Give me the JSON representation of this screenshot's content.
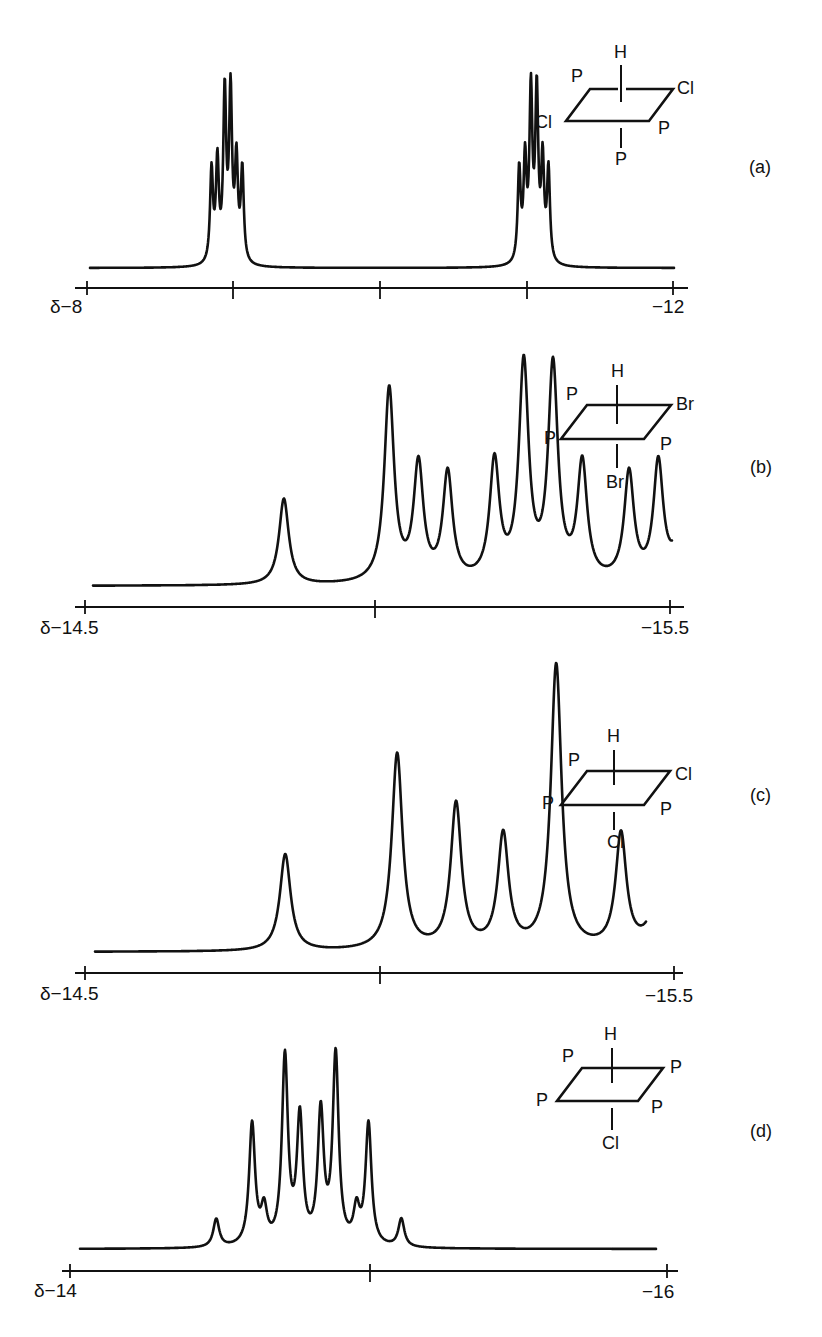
{
  "chart_data": [
    {
      "panel": "(a)",
      "type": "line",
      "title": "",
      "xlabel": "δ (ppm)",
      "ylabel": "",
      "xlim": [
        -8,
        -12
      ],
      "x_ticks": [
        -8,
        -9,
        -10,
        -11,
        -12
      ],
      "x_tick_labels": [
        "δ−8",
        "",
        "",
        "",
        "−12"
      ],
      "grid": false,
      "molecule": {
        "axial_top": "H",
        "axial_bottom": "P",
        "eq_back_left": "P",
        "eq_back_right": "Cl",
        "eq_front_left": "Cl",
        "eq_front_right": "P"
      },
      "multiplets": [
        {
          "center_ppm": -9.0,
          "peaks_ppm": [
            -8.85,
            -8.89,
            -8.94,
            -8.98,
            -9.02,
            -9.06,
            -9.11
          ],
          "rel_heights": [
            0.55,
            0.59,
            1.0,
            1.0,
            0.59,
            0.55,
            0.0
          ]
        },
        {
          "center_ppm": -11.1,
          "peaks_ppm": [
            -10.95,
            -10.99,
            -11.03,
            -11.07,
            -11.11,
            -11.15,
            -11.19
          ],
          "rel_heights": [
            0.55,
            0.59,
            1.0,
            1.0,
            0.59,
            0.55,
            0.0
          ]
        }
      ]
    },
    {
      "panel": "(b)",
      "type": "line",
      "xlabel": "δ (ppm)",
      "xlim": [
        -14.5,
        -15.5
      ],
      "x_ticks": [
        -14.5,
        -15.0,
        -15.5
      ],
      "x_tick_labels": [
        "δ−14.5",
        "",
        "−15.5"
      ],
      "grid": false,
      "molecule": {
        "axial_top": "H",
        "axial_bottom": "Br",
        "eq_back_left": "P",
        "eq_back_right": "Br",
        "eq_front_left": "P",
        "eq_front_right": "P"
      },
      "peaks_ppm": [
        -14.84,
        -15.02,
        -15.07,
        -15.12,
        -15.2,
        -15.25,
        -15.3,
        -15.35,
        -15.43,
        -15.48,
        -15.53,
        -15.71
      ],
      "rel_heights": [
        0.4,
        0.9,
        0.54,
        0.5,
        0.55,
        1.0,
        0.99,
        0.54,
        0.5,
        0.54,
        0.89,
        0.4
      ]
    },
    {
      "panel": "(c)",
      "type": "line",
      "xlabel": "δ (ppm)",
      "xlim": [
        -14.5,
        -15.5
      ],
      "x_ticks": [
        -14.5,
        -15.0,
        -15.5
      ],
      "x_tick_labels": [
        "δ−14.5",
        "",
        "−15.5"
      ],
      "grid": false,
      "molecule": {
        "axial_top": "H",
        "axial_bottom": "Cl",
        "eq_back_left": "P",
        "eq_back_right": "Cl",
        "eq_front_left": "P",
        "eq_front_right": "P"
      },
      "peaks_ppm": [
        -14.84,
        -15.03,
        -15.13,
        -15.21,
        -15.3,
        -15.41,
        -15.48,
        -15.59,
        -15.77
      ],
      "rel_heights": [
        0.34,
        0.69,
        0.51,
        0.4,
        1.0,
        0.4,
        0.51,
        0.69,
        0.34
      ]
    },
    {
      "panel": "(d)",
      "type": "line",
      "xlabel": "δ (ppm)",
      "xlim": [
        -14,
        -16
      ],
      "x_ticks": [
        -14,
        -15,
        -16
      ],
      "x_tick_labels": [
        "δ−14",
        "",
        "−16"
      ],
      "grid": false,
      "molecule": {
        "axial_top": "H",
        "axial_bottom": "Cl",
        "eq_back_left": "P",
        "eq_back_right": "P",
        "eq_front_left": "P",
        "eq_front_right": "P"
      },
      "peaks_ppm": [
        -14.49,
        -14.61,
        -14.65,
        -14.72,
        -14.77,
        -14.84,
        -14.89,
        -14.96,
        -15.0,
        -15.11
      ],
      "rel_heights": [
        0.15,
        0.65,
        0.18,
        1.0,
        0.67,
        0.7,
        1.01,
        0.18,
        0.65,
        0.15
      ]
    }
  ],
  "panels": [
    {
      "label": "(a)",
      "axis_left": "δ−8",
      "axis_right": "−12",
      "mol": {
        "top": "H",
        "bottom": "P",
        "back_left": "P",
        "back_right": "Cl",
        "front_left": "Cl",
        "front_right": "P"
      }
    },
    {
      "label": "(b)",
      "axis_left": "δ−14.5",
      "axis_right": "−15.5",
      "mol": {
        "top": "H",
        "bottom": "Br",
        "back_left": "P",
        "back_right": "Br",
        "front_left": "P",
        "front_right": "P"
      }
    },
    {
      "label": "(c)",
      "axis_left": "δ−14.5",
      "axis_right": "−15.5",
      "mol": {
        "top": "H",
        "bottom": "Cl",
        "back_left": "P",
        "back_right": "Cl",
        "front_left": "P",
        "front_right": "P"
      }
    },
    {
      "label": "(d)",
      "axis_left": "δ−14",
      "axis_right": "−16",
      "mol": {
        "top": "H",
        "bottom": "Cl",
        "back_left": "P",
        "back_right": "P",
        "front_left": "P",
        "front_right": "P"
      }
    }
  ]
}
